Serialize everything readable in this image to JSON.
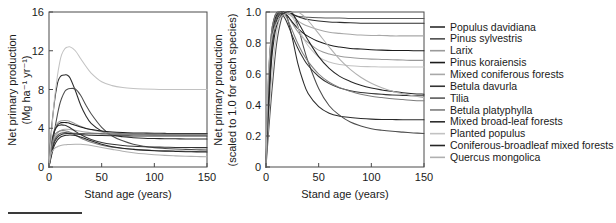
{
  "figure": {
    "caption_rule": "horizontal-rule",
    "background": "#ffffff"
  },
  "panels": {
    "left": {
      "name": "absolute-npp-panel",
      "ylabel_line1": "Net primary production",
      "ylabel_line2": "(Mg ha⁻¹ yr⁻¹)",
      "xlabel": "Stand age (years)",
      "yticks": [
        "0",
        "4",
        "8",
        "12",
        "16"
      ],
      "xticks": [
        "0",
        "50",
        "100",
        "150"
      ]
    },
    "right": {
      "name": "scaled-npp-panel",
      "ylabel_line1": "Net primary production",
      "ylabel_line2": "(scaled to 1.0 for each species)",
      "xlabel": "Stand age (years)",
      "yticks": [
        "0",
        "0.2",
        "0.4",
        "0.6",
        "0.8",
        "1.0"
      ],
      "xticks": [
        "0",
        "50",
        "100",
        "150"
      ]
    }
  },
  "legend": {
    "name": "species-legend",
    "items": [
      {
        "label": "Populus davidiana",
        "color": "#2b2b2b"
      },
      {
        "label": "Pinus sylvestris",
        "color": "#4d4d4d"
      },
      {
        "label": "Larix",
        "color": "#9a9a9a"
      },
      {
        "label": "Pinus koraiensis",
        "color": "#1c1c1c"
      },
      {
        "label": "Mixed coniferous forests",
        "color": "#a8a8a8"
      },
      {
        "label": "Betula davurla",
        "color": "#333333"
      },
      {
        "label": "Tilia",
        "color": "#5a5a5a"
      },
      {
        "label": "Betula platyphylla",
        "color": "#7d7d7d"
      },
      {
        "label": "Mixed broad-leaf forests",
        "color": "#2e2e2e"
      },
      {
        "label": "Planted populus",
        "color": "#c2c2c2"
      },
      {
        "label": "Coniferous-broadleaf mixed forests",
        "color": "#252525"
      },
      {
        "label": "Quercus mongolica",
        "color": "#b0b0b0"
      }
    ]
  },
  "chart_data": {
    "type": "line",
    "title": "",
    "xlabel": "Stand age (years)",
    "ylabel": "Net primary production (Mg ha-1 yr-1)",
    "xlim": [
      0,
      150
    ],
    "ylim_left": [
      0,
      16
    ],
    "ylim_right": [
      0,
      1.0
    ],
    "grid": false,
    "legend_position": "right",
    "x": [
      0,
      2,
      5,
      8,
      10,
      12,
      15,
      17,
      20,
      25,
      30,
      35,
      40,
      50,
      60,
      70,
      80,
      90,
      100,
      110,
      120,
      130,
      140,
      150
    ],
    "series": [
      {
        "name": "Populus davidiana",
        "color": "#2b2b2b",
        "peak_age": 17,
        "peak_value": 9.5,
        "plateau_value": 2.9,
        "values": [
          0.0,
          3.4,
          6.6,
          8.6,
          9.2,
          9.45,
          9.5,
          9.5,
          9.2,
          7.9,
          6.4,
          5.3,
          4.5,
          3.7,
          3.3,
          3.12,
          3.03,
          2.97,
          2.94,
          2.92,
          2.91,
          2.9,
          2.9,
          2.9
        ],
        "scaled": [
          0.0,
          0.358,
          0.695,
          0.905,
          0.968,
          0.995,
          1.0,
          1.0,
          0.968,
          0.832,
          0.674,
          0.558,
          0.474,
          0.389,
          0.347,
          0.328,
          0.319,
          0.313,
          0.309,
          0.307,
          0.306,
          0.305,
          0.305,
          0.305
        ]
      },
      {
        "name": "Pinus sylvestris",
        "color": "#4d4d4d",
        "peak_age": 25,
        "peak_value": 8.1,
        "plateau_value": 1.75,
        "values": [
          0.0,
          1.5,
          3.6,
          5.4,
          6.4,
          7.1,
          7.8,
          8.0,
          8.1,
          8.05,
          7.4,
          6.4,
          5.5,
          4.1,
          3.2,
          2.7,
          2.35,
          2.15,
          2.0,
          1.92,
          1.86,
          1.82,
          1.78,
          1.75
        ],
        "scaled": [
          0.0,
          0.185,
          0.444,
          0.667,
          0.79,
          0.877,
          0.963,
          0.988,
          1.0,
          0.994,
          0.914,
          0.79,
          0.679,
          0.506,
          0.395,
          0.333,
          0.29,
          0.265,
          0.247,
          0.237,
          0.23,
          0.225,
          0.22,
          0.216
        ]
      },
      {
        "name": "Larix",
        "color": "#9a9a9a",
        "peak_age": 14,
        "peak_value": 4.8,
        "plateau_value": 3.3,
        "values": [
          0.0,
          2.1,
          3.8,
          4.5,
          4.7,
          4.78,
          4.8,
          4.78,
          4.7,
          4.45,
          4.2,
          4.0,
          3.85,
          3.62,
          3.5,
          3.43,
          3.39,
          3.36,
          3.34,
          3.33,
          3.32,
          3.31,
          3.3,
          3.3
        ],
        "scaled": [
          0.0,
          0.438,
          0.792,
          0.938,
          0.979,
          0.996,
          1.0,
          0.996,
          0.979,
          0.927,
          0.875,
          0.833,
          0.802,
          0.754,
          0.729,
          0.715,
          0.706,
          0.7,
          0.696,
          0.694,
          0.692,
          0.69,
          0.688,
          0.688
        ]
      },
      {
        "name": "Pinus koraiensis",
        "color": "#1c1c1c",
        "peak_age": 13,
        "peak_value": 4.6,
        "plateau_value": 3.45,
        "values": [
          0.0,
          2.0,
          3.6,
          4.3,
          4.5,
          4.58,
          4.6,
          4.57,
          4.5,
          4.3,
          4.12,
          3.98,
          3.88,
          3.72,
          3.62,
          3.56,
          3.52,
          3.5,
          3.48,
          3.47,
          3.46,
          3.46,
          3.45,
          3.45
        ],
        "scaled": [
          0.0,
          0.435,
          0.783,
          0.935,
          0.978,
          0.996,
          1.0,
          0.993,
          0.978,
          0.935,
          0.896,
          0.865,
          0.843,
          0.809,
          0.787,
          0.774,
          0.765,
          0.761,
          0.757,
          0.754,
          0.752,
          0.752,
          0.75,
          0.75
        ]
      },
      {
        "name": "Mixed coniferous forests",
        "color": "#a8a8a8",
        "peak_age": 16,
        "peak_value": 3.9,
        "plateau_value": 3.3,
        "values": [
          0.0,
          1.5,
          2.9,
          3.5,
          3.7,
          3.82,
          3.89,
          3.9,
          3.88,
          3.78,
          3.68,
          3.6,
          3.54,
          3.45,
          3.39,
          3.36,
          3.34,
          3.32,
          3.31,
          3.31,
          3.3,
          3.3,
          3.3,
          3.3
        ],
        "scaled": [
          0.0,
          0.385,
          0.744,
          0.897,
          0.949,
          0.98,
          0.997,
          1.0,
          0.995,
          0.969,
          0.944,
          0.923,
          0.908,
          0.885,
          0.869,
          0.862,
          0.856,
          0.851,
          0.849,
          0.849,
          0.846,
          0.846,
          0.846,
          0.846
        ]
      },
      {
        "name": "Betula davurla",
        "color": "#333333",
        "peak_age": 12,
        "peak_value": 4.35,
        "plateau_value": 2.0,
        "values": [
          0.0,
          2.2,
          3.7,
          4.2,
          4.32,
          4.35,
          4.3,
          4.22,
          4.05,
          3.68,
          3.35,
          3.07,
          2.85,
          2.54,
          2.34,
          2.22,
          2.14,
          2.09,
          2.06,
          2.04,
          2.02,
          2.01,
          2.0,
          2.0
        ],
        "scaled": [
          0.0,
          0.506,
          0.851,
          0.966,
          0.993,
          1.0,
          0.989,
          0.97,
          0.931,
          0.846,
          0.77,
          0.706,
          0.655,
          0.584,
          0.538,
          0.51,
          0.492,
          0.48,
          0.474,
          0.469,
          0.464,
          0.462,
          0.46,
          0.46
        ]
      },
      {
        "name": "Tilia",
        "color": "#5a5a5a",
        "peak_age": 15,
        "peak_value": 3.55,
        "plateau_value": 3.4,
        "values": [
          0.0,
          1.4,
          2.7,
          3.25,
          3.42,
          3.5,
          3.55,
          3.54,
          3.52,
          3.48,
          3.45,
          3.44,
          3.43,
          3.42,
          3.41,
          3.41,
          3.4,
          3.4,
          3.4,
          3.4,
          3.4,
          3.4,
          3.4,
          3.4
        ],
        "scaled": [
          0.0,
          0.394,
          0.761,
          0.915,
          0.963,
          0.986,
          1.0,
          0.997,
          0.991,
          0.98,
          0.972,
          0.969,
          0.966,
          0.963,
          0.961,
          0.961,
          0.958,
          0.958,
          0.958,
          0.958,
          0.958,
          0.958,
          0.958,
          0.958
        ]
      },
      {
        "name": "Betula platyphylla",
        "color": "#7d7d7d",
        "peak_age": 14,
        "peak_value": 3.75,
        "plateau_value": 1.6,
        "values": [
          0.0,
          1.9,
          3.2,
          3.6,
          3.71,
          3.75,
          3.74,
          3.7,
          3.6,
          3.3,
          3.0,
          2.75,
          2.55,
          2.25,
          2.05,
          1.92,
          1.83,
          1.76,
          1.71,
          1.68,
          1.65,
          1.63,
          1.61,
          1.6
        ],
        "scaled": [
          0.0,
          0.507,
          0.853,
          0.96,
          0.989,
          1.0,
          0.997,
          0.987,
          0.96,
          0.88,
          0.8,
          0.733,
          0.68,
          0.6,
          0.547,
          0.512,
          0.488,
          0.469,
          0.456,
          0.448,
          0.44,
          0.435,
          0.429,
          0.427
        ]
      },
      {
        "name": "Mixed broad-leaf forests",
        "color": "#2e2e2e",
        "peak_age": 18,
        "peak_value": 3.45,
        "plateau_value": 3.2,
        "values": [
          0.0,
          1.2,
          2.5,
          3.05,
          3.25,
          3.36,
          3.43,
          3.45,
          3.45,
          3.41,
          3.35,
          3.31,
          3.28,
          3.25,
          3.23,
          3.22,
          3.21,
          3.2,
          3.2,
          3.2,
          3.2,
          3.2,
          3.2,
          3.2
        ],
        "scaled": [
          0.0,
          0.348,
          0.725,
          0.884,
          0.942,
          0.974,
          0.994,
          1.0,
          1.0,
          0.988,
          0.971,
          0.959,
          0.951,
          0.942,
          0.936,
          0.933,
          0.93,
          0.928,
          0.928,
          0.928,
          0.928,
          0.928,
          0.928,
          0.928
        ]
      },
      {
        "name": "Planted populus",
        "color": "#c2c2c2",
        "peak_age": 20,
        "peak_value": 12.4,
        "plateau_value": 8.0,
        "values": [
          0.0,
          3.0,
          6.8,
          9.4,
          10.7,
          11.6,
          12.2,
          12.35,
          12.4,
          12.0,
          11.2,
          10.4,
          9.7,
          8.8,
          8.4,
          8.2,
          8.1,
          8.05,
          8.02,
          8.0,
          8.0,
          8.0,
          8.0,
          8.0
        ],
        "scaled": [
          0.0,
          0.242,
          0.548,
          0.758,
          0.863,
          0.935,
          0.984,
          0.996,
          1.0,
          0.968,
          0.903,
          0.839,
          0.782,
          0.71,
          0.677,
          0.661,
          0.653,
          0.649,
          0.647,
          0.645,
          0.645,
          0.645,
          0.645,
          0.645
        ]
      },
      {
        "name": "Coniferous-broadleaf mixed forests",
        "color": "#252525",
        "peak_age": 22,
        "peak_value": 3.3,
        "plateau_value": 1.55,
        "values": [
          0.0,
          1.0,
          2.2,
          2.78,
          3.0,
          3.14,
          3.25,
          3.28,
          3.3,
          3.26,
          3.1,
          2.9,
          2.7,
          2.35,
          2.1,
          1.93,
          1.82,
          1.74,
          1.68,
          1.64,
          1.61,
          1.58,
          1.56,
          1.55
        ],
        "scaled": [
          0.0,
          0.303,
          0.667,
          0.842,
          0.909,
          0.952,
          0.985,
          0.994,
          1.0,
          0.988,
          0.939,
          0.879,
          0.818,
          0.712,
          0.636,
          0.585,
          0.552,
          0.527,
          0.509,
          0.497,
          0.488,
          0.479,
          0.473,
          0.47
        ]
      },
      {
        "name": "Quercus mongolica",
        "color": "#b0b0b0",
        "peak_age": 30,
        "peak_value": 2.35,
        "plateau_value": 1.05,
        "values": [
          0.0,
          1.35,
          1.9,
          2.1,
          2.18,
          2.24,
          2.29,
          2.31,
          2.33,
          2.35,
          2.35,
          2.3,
          2.22,
          2.02,
          1.82,
          1.63,
          1.48,
          1.36,
          1.27,
          1.2,
          1.15,
          1.11,
          1.08,
          1.05
        ],
        "scaled": [
          0.0,
          0.574,
          0.809,
          0.894,
          0.928,
          0.953,
          0.974,
          0.983,
          0.991,
          1.0,
          1.0,
          0.979,
          0.945,
          0.86,
          0.774,
          0.694,
          0.63,
          0.579,
          0.54,
          0.511,
          0.489,
          0.472,
          0.46,
          0.447
        ]
      }
    ]
  }
}
